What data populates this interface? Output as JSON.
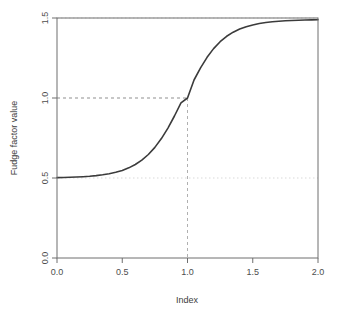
{
  "chart_data": {
    "type": "line",
    "title": "",
    "xlabel": "Index",
    "ylabel": "Fudge factor value",
    "xlim": [
      0.0,
      2.0
    ],
    "ylim": [
      0.0,
      1.5
    ],
    "xticks": [
      "0.0",
      "0.5",
      "1.0",
      "1.5",
      "2.0"
    ],
    "xtick_values": [
      0.0,
      0.5,
      1.0,
      1.5,
      2.0
    ],
    "yticks": [
      "0.0",
      "0.5",
      "1.0",
      "1.5"
    ],
    "ytick_values": [
      0.0,
      0.5,
      1.0,
      1.5
    ],
    "grid": false,
    "legend": null,
    "series": [
      {
        "name": "fudge factor",
        "color": "#3b3b3b",
        "linewidth": 1.6,
        "description": "logistic curve: 0.5 + 1.0/(1+exp(-6*(x-1)))",
        "x": [
          0.0,
          0.05,
          0.1,
          0.15,
          0.2,
          0.25,
          0.3,
          0.35,
          0.4,
          0.45,
          0.5,
          0.55,
          0.6,
          0.65,
          0.7,
          0.75,
          0.8,
          0.85,
          0.9,
          0.95,
          1.0,
          1.05,
          1.1,
          1.15,
          1.2,
          1.25,
          1.3,
          1.35,
          1.4,
          1.45,
          1.5,
          1.55,
          1.6,
          1.65,
          1.7,
          1.75,
          1.8,
          1.85,
          1.9,
          1.95,
          2.0
        ],
        "y": [
          0.5025,
          0.5033,
          0.5045,
          0.5061,
          0.5082,
          0.511,
          0.5148,
          0.5198,
          0.5266,
          0.5354,
          0.5474,
          0.5633,
          0.5842,
          0.6116,
          0.6469,
          0.6915,
          0.7465,
          0.8122,
          0.8875,
          0.9698,
          1.0,
          1.1125,
          1.1881,
          1.2541,
          1.3085,
          1.3519,
          1.3856,
          1.4113,
          1.4309,
          1.4456,
          1.4568,
          1.4652,
          1.4715,
          1.4763,
          1.4799,
          1.4827,
          1.4848,
          1.4864,
          1.4876,
          1.4885,
          1.4892
        ]
      }
    ],
    "reference_lines": [
      {
        "name": "upper-asymptote",
        "orientation": "horizontal",
        "value": 1.5,
        "style": "dotted",
        "color": "#d9d9d9"
      },
      {
        "name": "lower-asymptote",
        "orientation": "horizontal",
        "value": 0.5,
        "style": "dotted",
        "color": "#d9d9d9"
      },
      {
        "name": "midpoint-horizontal",
        "orientation": "horizontal",
        "value": 1.0,
        "style": "dashed",
        "color": "#8f8f8f",
        "from_x": 0.0,
        "to_x": 1.0
      },
      {
        "name": "midpoint-vertical",
        "orientation": "vertical",
        "value": 1.0,
        "style": "dashed",
        "color": "#b0b0b0",
        "from_y": 0.0,
        "to_y": 1.0
      }
    ],
    "annotations": [
      {
        "name": "midpoint",
        "x": 1.0,
        "y": 1.0
      }
    ]
  },
  "style": {
    "frame_color": "#6e6e6e",
    "tick_color": "#6e6e6e",
    "text_color": "#4d4d4d",
    "background": "#ffffff"
  }
}
